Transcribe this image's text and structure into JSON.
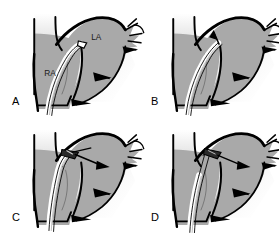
{
  "figure": {
    "panel_count": 4,
    "background_color": "#ffffff",
    "tissue_fill_color": "#a9a9a9",
    "outline_color": "#000000",
    "shadow_color": "#c9c9c9",
    "label_color": "#1a1a1a"
  },
  "panels": [
    {
      "letter": "A",
      "chamber_labels": [
        {
          "text": "RA",
          "meaning": "right-atrium"
        },
        {
          "text": "LA",
          "meaning": "left-atrium"
        }
      ],
      "stage": "catheter-in-right-atrium"
    },
    {
      "letter": "B",
      "chamber_labels": [],
      "stage": "needle-tenting-septum"
    },
    {
      "letter": "C",
      "chamber_labels": [],
      "stage": "septal-puncture"
    },
    {
      "letter": "D",
      "chamber_labels": [],
      "stage": "sheath-advanced-into-left-atrium"
    }
  ]
}
